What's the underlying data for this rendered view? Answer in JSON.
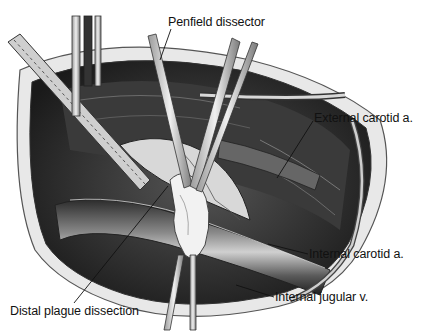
{
  "figure": {
    "labels": [
      {
        "id": "penfield",
        "text": "Penfield dissector",
        "x": 168,
        "y": 16
      },
      {
        "id": "ext-carotid",
        "text": "External carotid a.",
        "x": 314,
        "y": 112
      },
      {
        "id": "int-carotid",
        "text": "Internal carotid a.",
        "x": 309,
        "y": 248
      },
      {
        "id": "int-jugular",
        "text": "Internal jugular v.",
        "x": 275,
        "y": 291
      },
      {
        "id": "distal-plaque",
        "text": "Distal plague dissection",
        "x": 10,
        "y": 305
      }
    ],
    "colors": {
      "background": "#ffffff",
      "ink": "#111111",
      "dark_tissue": "#2a2a2a",
      "mid_tissue": "#7a7a7a",
      "light_tissue": "#d8d8d8"
    }
  }
}
